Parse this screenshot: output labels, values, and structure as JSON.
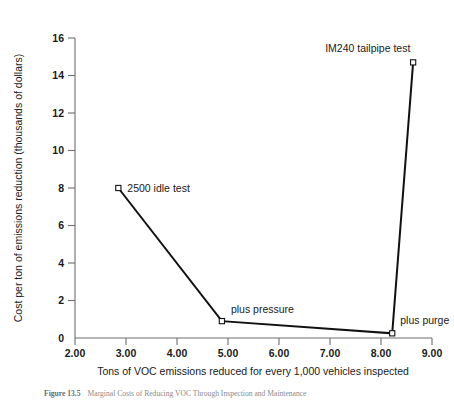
{
  "figure": {
    "caption_label": "Figure 13.5",
    "caption_text": "Marginal Costs of Reducing VOC Through Inspection and Maintenance"
  },
  "chart_data": {
    "type": "line",
    "title": "",
    "xlabel": "Tons of VOC emissions reduced for every 1,000 vehicles inspected",
    "ylabel": "Cost per ton of emissions reduction (thousands of dollars)",
    "xlim": [
      2.0,
      9.0
    ],
    "ylim": [
      0,
      16
    ],
    "grid": false,
    "legend_position": "none",
    "marker": "open-square",
    "xticks": [
      "2.00",
      "3.00",
      "4.00",
      "5.00",
      "6.00",
      "7.00",
      "8.00",
      "9.00"
    ],
    "xtick_values": [
      2.0,
      3.0,
      4.0,
      5.0,
      6.0,
      7.0,
      8.0,
      9.0
    ],
    "yticks": [
      "0",
      "2",
      "4",
      "6",
      "8",
      "10",
      "12",
      "14",
      "16"
    ],
    "ytick_values": [
      0,
      2,
      4,
      6,
      8,
      10,
      12,
      14,
      16
    ],
    "series": [
      {
        "name": "Marginal cost of VOC reduction",
        "points": [
          {
            "label": "2500 idle test",
            "x": 2.85,
            "y": 8.0,
            "label_dx": 9,
            "label_dy": 4
          },
          {
            "label": "plus pressure",
            "x": 4.88,
            "y": 0.9,
            "label_dx": 9,
            "label_dy": -8
          },
          {
            "label": "plus purge",
            "x": 8.22,
            "y": 0.25,
            "label_dx": 8,
            "label_dy": -9
          },
          {
            "label": "IM240 tailpipe test",
            "x": 8.63,
            "y": 14.7,
            "label_dx": -88,
            "label_dy": -10
          }
        ]
      }
    ]
  }
}
